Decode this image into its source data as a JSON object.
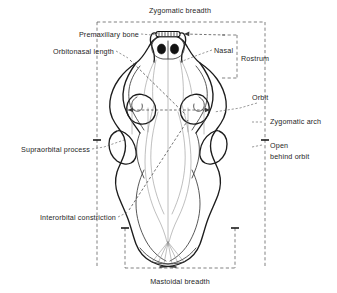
{
  "figure": {
    "background_color": "#ffffff",
    "ink_color": "#1c1c1c",
    "label_color": "#262626",
    "guide_color": "#4a4a4a"
  },
  "labels": {
    "zygomatic_breadth": "Zygomatic breadth",
    "premaxillary_bone": "Premaxillary bone",
    "orbitonasal_length": "Orbitonasal length",
    "nasal": "Nasal",
    "rostrum": "Rostrum",
    "orbit": "Orbit",
    "zygomatic_arch": "Zygomatic arch",
    "open_behind_orbit_line1": "Open",
    "open_behind_orbit_line2": "behind orbit",
    "supraorbital_process": "Supraorbital process",
    "interorbital_constriction": "Interorbital constriction",
    "mastoidal_breadth": "Mastoidal breadth"
  },
  "measurements": {
    "zygomatic_breadth_box": {
      "x1": 97,
      "y1": 22,
      "x2": 265,
      "y2": 268
    },
    "rostrum_bracket": {
      "x1": 222,
      "y1": 35,
      "x2": 237,
      "y2": 78
    },
    "mastoidal_breadth_box": {
      "x1": 125,
      "y1": 228,
      "x2": 235,
      "y2": 268
    },
    "orbitonasal_arrow": {
      "from_x": 112,
      "from_y": 62,
      "to_x": 172,
      "to_y": 112
    },
    "interorbital_arrow": {
      "from_x": 126,
      "from_y": 232,
      "to_x": 186,
      "to_y": 118
    },
    "orbit_width_arrow": {
      "x1": 126,
      "y1": 110,
      "x2": 212,
      "y2": 110
    }
  }
}
